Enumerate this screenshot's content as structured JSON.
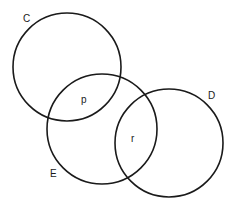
{
  "diagram": {
    "type": "venn",
    "circles": [
      {
        "id": "C",
        "label": "C",
        "cx": 67,
        "cy": 67,
        "r": 54,
        "label_x": 23,
        "label_y": 22
      },
      {
        "id": "E",
        "label": "E",
        "cx": 102,
        "cy": 129,
        "r": 55,
        "label_x": 50,
        "label_y": 177
      },
      {
        "id": "D",
        "label": "D",
        "cx": 169,
        "cy": 143,
        "r": 54,
        "label_x": 208,
        "label_y": 99
      }
    ],
    "region_labels": [
      {
        "id": "p",
        "label": "p",
        "x": 81,
        "y": 103,
        "region": "C ∩ E"
      },
      {
        "id": "r",
        "label": "r",
        "x": 131,
        "y": 142,
        "region": "E ∩ D"
      }
    ],
    "stroke_color": "#1a1a1a",
    "background": "#ffffff"
  }
}
